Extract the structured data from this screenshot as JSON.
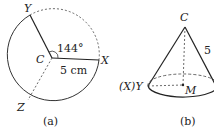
{
  "figure_a": {
    "caption": "(a)",
    "center_label": "C",
    "points": {
      "x": "X",
      "y": "Y",
      "z": "Z"
    },
    "angle_label": "144°",
    "radius_label": "5 cm"
  },
  "figure_b": {
    "caption": "(b)",
    "apex_label": "C",
    "base_center_label": "M",
    "edge_point_label": "(X)Y",
    "slant_label": "5"
  }
}
